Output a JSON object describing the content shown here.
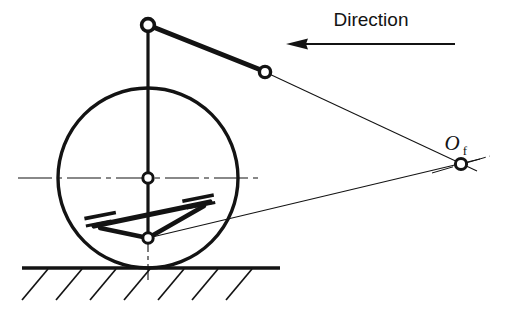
{
  "figure": {
    "background_color": "#ffffff",
    "ink_color": "#131313",
    "width": 506,
    "height": 313
  },
  "annotations": {
    "direction_label": "Direction",
    "pole_label": "O",
    "pole_subscript": "f"
  },
  "geometry": {
    "wheel": {
      "center_x": 148,
      "center_y": 178,
      "radius": 90,
      "stroke_width": 3.4
    },
    "ground": {
      "y": 268,
      "x_start": 22,
      "x_end": 280,
      "hatch_count": 7,
      "hatch_length": 26,
      "hatch_angle_deg": 45
    },
    "joints": [
      {
        "name": "upper-strut-top-joint",
        "x": 148,
        "y": 25,
        "r_outer": 6.2,
        "r_inner": 2.8
      },
      {
        "name": "upper-arm-outer-joint",
        "x": 265,
        "y": 72,
        "r_outer": 5.6,
        "r_inner": 2.4
      },
      {
        "name": "wheel-center-joint",
        "x": 148,
        "y": 178,
        "r_outer": 5.4,
        "r_inner": 2.4
      },
      {
        "name": "lower-ball-joint",
        "x": 148,
        "y": 238,
        "r_outer": 5.4,
        "r_inner": 2.4
      },
      {
        "name": "instant-centre-pole",
        "x": 461,
        "y": 164,
        "r_outer": 5.6,
        "r_inner": 2.6
      }
    ],
    "links": [
      {
        "name": "upper-strut-vertical",
        "x1": 148,
        "y1": 25,
        "x2": 148,
        "y2": 178,
        "width": 3.2
      },
      {
        "name": "upper-control-arm",
        "x1": 148,
        "y1": 25,
        "x2": 265,
        "y2": 72,
        "width": 4.6
      },
      {
        "name": "kingpin-lower-segment",
        "x1": 148,
        "y1": 178,
        "x2": 148,
        "y2": 238,
        "width": 3.2
      },
      {
        "name": "lower-arm-forward-leg",
        "x1": 148,
        "y1": 238,
        "x2": 98,
        "y2": 222,
        "width": 4.6
      },
      {
        "name": "lower-arm-rear-leg",
        "x1": 148,
        "y1": 238,
        "x2": 205,
        "y2": 205,
        "width": 4.6
      },
      {
        "name": "lower-arm-cross-member",
        "x1": 92,
        "y1": 224,
        "x2": 208,
        "y2": 203,
        "width": 4.6
      }
    ],
    "bushings": [
      {
        "name": "lower-arm-front-bushing",
        "x": 101,
        "y": 219,
        "angle_deg": -11
      },
      {
        "name": "lower-arm-rear-bushing",
        "x": 199,
        "y": 203,
        "angle_deg": -11
      }
    ],
    "construction_lines": [
      {
        "name": "upper-projection-line",
        "x1": 265,
        "y1": 72,
        "x2": 475,
        "y2": 170,
        "width": 1.0
      },
      {
        "name": "lower-projection-line",
        "x1": 148,
        "y1": 238,
        "x2": 478,
        "y2": 160,
        "width": 1.0
      }
    ],
    "centre_lines": [
      {
        "name": "wheel-horizontal-centre-line",
        "x1": 18,
        "y1": 178,
        "x2": 262,
        "y2": 178
      },
      {
        "name": "wheel-vertical-centre-line",
        "x1": 148,
        "y1": 238,
        "x2": 148,
        "y2": 282
      }
    ],
    "direction_arrow": {
      "name": "direction-arrow",
      "tip_x": 287,
      "tail_x": 455,
      "y": 44,
      "head_length": 20,
      "head_half_width": 5,
      "shaft_width": 2.0
    },
    "direction_text_pos": {
      "x": 371,
      "y": 25
    },
    "pole_text_pos": {
      "x": 452,
      "y": 148,
      "sub_x": 468,
      "sub_y": 153
    }
  }
}
